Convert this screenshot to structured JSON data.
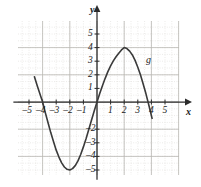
{
  "figure": {
    "axis_labels": {
      "x": "x",
      "y": "y"
    },
    "curve_label": "g"
  },
  "chart_data": {
    "type": "line",
    "title": "",
    "xlabel": "x",
    "ylabel": "y",
    "grid": true,
    "legend": "none",
    "annotations": [
      {
        "text": "g",
        "x": 2.95,
        "y": 3.35
      }
    ],
    "xlim": [
      -6,
      6
    ],
    "ylim": [
      -6,
      6
    ],
    "x_ticks": [
      -5,
      -4,
      -3,
      -2,
      -1,
      1,
      2,
      3,
      4,
      5
    ],
    "x_tick_labels": [
      "–5",
      "–4",
      "–3",
      "–2",
      "–1",
      "1",
      "2",
      "3",
      "4",
      "5"
    ],
    "y_ticks": [
      5,
      4,
      3,
      2,
      1,
      -2,
      -3,
      -4,
      -5
    ],
    "y_tick_labels": [
      "5",
      "4",
      "3",
      "2",
      "1",
      "–2",
      "–3",
      "–4",
      "–5"
    ],
    "major_gridlines_x": [
      -6,
      -4,
      -2,
      0,
      2,
      4,
      6
    ],
    "major_gridlines_y": [
      -6,
      -4,
      -2,
      0,
      2,
      4,
      6
    ],
    "minor_gridline_step": 0.5,
    "series": [
      {
        "name": "g",
        "color": "#3a3a3a",
        "zeros": [
          -4,
          0,
          4
        ],
        "minimum": {
          "x": -2,
          "y": -5
        },
        "maximum": {
          "x": 2,
          "y": 4
        },
        "x": [
          -4.6,
          -4.4,
          -4.2,
          -4.0,
          -3.8,
          -3.6,
          -3.4,
          -3.2,
          -3.0,
          -2.8,
          -2.6,
          -2.4,
          -2.2,
          -2.0,
          -1.8,
          -1.6,
          -1.4,
          -1.2,
          -1.0,
          -0.8,
          -0.6,
          -0.4,
          -0.2,
          0.0,
          0.2,
          0.4,
          0.6,
          0.8,
          1.0,
          1.2,
          1.4,
          1.6,
          1.8,
          2.0,
          2.2,
          2.4,
          2.6,
          2.8,
          3.0,
          3.2,
          3.4,
          3.6,
          3.8,
          4.0,
          4.05
        ],
        "y": [
          1.85,
          1.21,
          0.6,
          0.0,
          -0.78,
          -1.53,
          -2.25,
          -2.91,
          -3.54,
          -4.05,
          -4.48,
          -4.78,
          -4.95,
          -5.0,
          -4.9,
          -4.68,
          -4.33,
          -3.86,
          -3.3,
          -2.68,
          -2.0,
          -1.32,
          -0.65,
          0.0,
          0.62,
          1.2,
          1.74,
          2.23,
          2.65,
          3.02,
          3.33,
          3.59,
          3.83,
          4.0,
          3.93,
          3.74,
          3.46,
          3.06,
          2.56,
          1.98,
          1.31,
          0.6,
          -0.18,
          -1.0,
          -1.2
        ]
      }
    ]
  },
  "geometry": {
    "origin_x": 97,
    "origin_y": 102,
    "unit_px": 13.6,
    "plot_left": 18,
    "plot_right": 179,
    "plot_top": 21,
    "plot_bottom": 175
  }
}
